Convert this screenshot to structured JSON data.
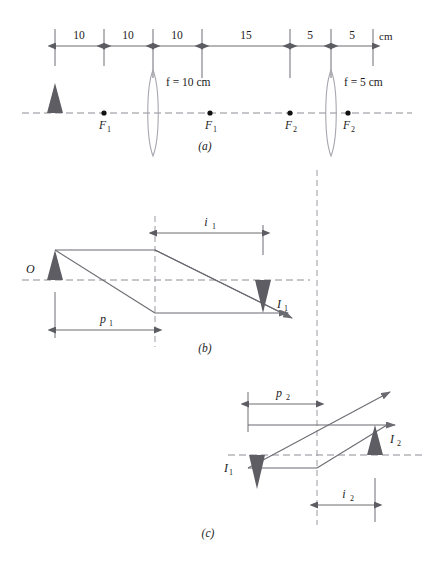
{
  "figure": {
    "panels": [
      {
        "id": "a",
        "label": "(a)"
      },
      {
        "id": "b",
        "label": "(b)"
      },
      {
        "id": "c",
        "label": "(c)"
      }
    ]
  },
  "scale": {
    "unit": "cm",
    "segments": [
      {
        "value": "10"
      },
      {
        "value": "10"
      },
      {
        "value": "10"
      },
      {
        "value": "15"
      },
      {
        "value": "5"
      },
      {
        "value": "5"
      }
    ]
  },
  "panel_a": {
    "lens1_label": "f = 10 cm",
    "lens2_label": "f = 5 cm",
    "focal_points": [
      {
        "base": "F",
        "sub": "1"
      },
      {
        "base": "F",
        "sub": "1"
      },
      {
        "base": "F",
        "sub": "2"
      },
      {
        "base": "F",
        "sub": "2"
      }
    ],
    "panel_label": "(a)"
  },
  "panel_b": {
    "object_label": "O",
    "image_label_base": "I",
    "image_label_sub": "1",
    "object_distance_base": "p",
    "object_distance_sub": "1",
    "image_distance_base": "i",
    "image_distance_sub": "1",
    "panel_label": "(b)"
  },
  "panel_c": {
    "image1_label_base": "I",
    "image1_label_sub": "1",
    "image2_label_base": "I",
    "image2_label_sub": "2",
    "object_distance_base": "p",
    "object_distance_sub": "2",
    "image_distance_base": "i",
    "image_distance_sub": "2",
    "panel_label": "(c)"
  },
  "colors": {
    "background": "#ffffff",
    "triangle_fill": "#5d5d63",
    "ray_stroke": "#6b6b72",
    "axis_dash": "#8e8e96",
    "lens_stroke": "#a7a7b0",
    "text": "#1b1b1b"
  }
}
